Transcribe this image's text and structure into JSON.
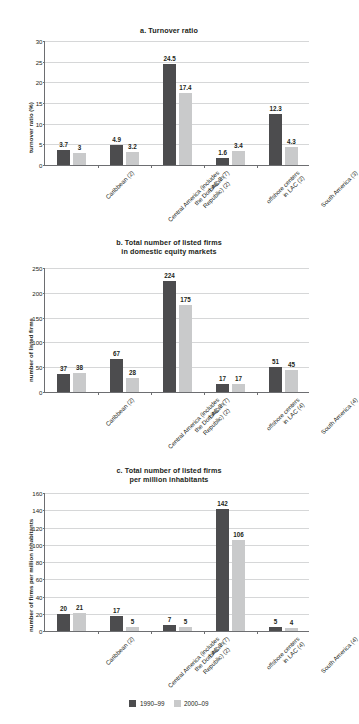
{
  "figure": {
    "legend": [
      {
        "label": "1990–99",
        "color": "#4c4c4e"
      },
      {
        "label": "2000–09",
        "color": "#c9cacb"
      }
    ]
  },
  "chart_data": [
    {
      "type": "bar",
      "title": "a. Turnover ratio",
      "title_lines": [
        "a. Turnover ratio"
      ],
      "xlabel": "",
      "ylabel": "turnover ratio (%)",
      "ylim": [
        0,
        30
      ],
      "yticks": [
        0,
        5,
        10,
        15,
        20,
        25,
        30
      ],
      "grid": true,
      "legend_position": "bottom",
      "categories": [
        "Caribbean (2)",
        "Central America (includes the Dominican Republic) (2)",
        "LAC-7 (7)",
        "offshore centers in LAC (2)",
        "South America (3)"
      ],
      "category_lines": [
        [
          "Caribbean (2)"
        ],
        [
          "Central America (includes",
          "the Dominican",
          "Republic) (2)"
        ],
        [
          "LAC-7 (7)"
        ],
        [
          "offshore centers",
          "in LAC (2)"
        ],
        [
          "South America (3)"
        ]
      ],
      "series": [
        {
          "name": "1990–99",
          "values": [
            3.7,
            4.9,
            24.5,
            1.6,
            12.3
          ]
        },
        {
          "name": "2000–09",
          "values": [
            3.0,
            3.2,
            17.4,
            3.4,
            4.3
          ]
        }
      ]
    },
    {
      "type": "bar",
      "title": "b. Total number of listed firms in domestic equity markets",
      "title_lines": [
        "b. Total number of listed firms",
        "in domestic equity markets"
      ],
      "xlabel": "",
      "ylabel": "number of listed firms",
      "ylim": [
        0,
        250
      ],
      "yticks": [
        0,
        50,
        100,
        150,
        200,
        250
      ],
      "grid": true,
      "legend_position": "bottom",
      "categories": [
        "Caribbean (2)",
        "Central America (includes the Dominican Republic) (2)",
        "LAC-7 (7)",
        "offshore centers in LAC (4)",
        "South America (4)"
      ],
      "category_lines": [
        [
          "Caribbean (2)"
        ],
        [
          "Central America (includes",
          "the Dominican",
          "Republic) (2)"
        ],
        [
          "LAC-7 (7)"
        ],
        [
          "offshore centers",
          "in LAC (4)"
        ],
        [
          "South America (4)"
        ]
      ],
      "series": [
        {
          "name": "1990–99",
          "values": [
            37,
            67,
            224,
            17,
            51
          ]
        },
        {
          "name": "2000–09",
          "values": [
            38,
            28,
            175,
            17,
            45
          ]
        }
      ]
    },
    {
      "type": "bar",
      "title": "c. Total number of listed firms per million inhabitants",
      "title_lines": [
        "c. Total number of listed firms",
        "per million inhabitants"
      ],
      "xlabel": "",
      "ylabel": "number of firms per million inhabitants",
      "ylim": [
        0,
        160
      ],
      "yticks": [
        0,
        20,
        40,
        60,
        80,
        100,
        120,
        140,
        160
      ],
      "grid": true,
      "legend_position": "bottom",
      "categories": [
        "Caribbean (2)",
        "Central America (includes the Dominican Republic) (2)",
        "LAC-7 (7)",
        "offshore centers in LAC (4)",
        "South America (4)"
      ],
      "category_lines": [
        [
          "Caribbean (2)"
        ],
        [
          "Central America (includes",
          "the Dominican",
          "Republic) (2)"
        ],
        [
          "LAC-7 (7)"
        ],
        [
          "offshore centers",
          "in LAC (4)"
        ],
        [
          "South America (4)"
        ]
      ],
      "series": [
        {
          "name": "1990–99",
          "values": [
            20,
            17,
            7,
            142,
            5
          ]
        },
        {
          "name": "2000–09",
          "values": [
            21,
            5,
            5,
            106,
            4
          ]
        }
      ]
    }
  ]
}
